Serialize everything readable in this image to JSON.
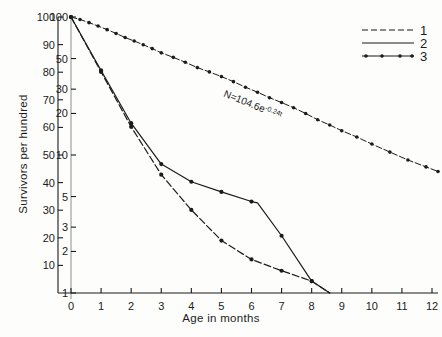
{
  "chart_data": {
    "type": "line",
    "title": "",
    "xlabel": "Age in months",
    "ylabel": "Survivors per hundred",
    "x_ticks": [
      "0",
      "1",
      "2",
      "3",
      "4",
      "5",
      "6",
      "7",
      "8",
      "9",
      "10",
      "11",
      "12"
    ],
    "xlim": [
      0,
      12
    ],
    "y_axis_left": {
      "scale": "linear",
      "ticks": [
        "100",
        "90",
        "80",
        "70",
        "60",
        "50",
        "40",
        "30",
        "20",
        "10"
      ],
      "tick_values": [
        100,
        90,
        80,
        70,
        60,
        50,
        40,
        30,
        20,
        10
      ],
      "ylim": [
        0,
        100
      ]
    },
    "y_axis_log": {
      "scale": "log",
      "ticks": [
        "100",
        "50",
        "30",
        "20",
        "10",
        "5",
        "3",
        "2",
        "1"
      ],
      "tick_values": [
        100,
        50,
        30,
        20,
        10,
        5,
        3,
        2,
        1
      ],
      "ylim": [
        1,
        100
      ]
    },
    "grid": false,
    "legend_position": "top-right",
    "annotations": [
      {
        "name": "fitted-equation",
        "text": "N=104.6e",
        "superscript": "-0.24t",
        "x": 6.0,
        "y": 22
      }
    ],
    "series": [
      {
        "name": "1",
        "label": "1",
        "style": "dashed",
        "marker": "none",
        "color": "#1b1b1b",
        "x": [
          0,
          1,
          2,
          3,
          4,
          5,
          6,
          7,
          8,
          8.6
        ],
        "y": [
          100,
          40,
          16,
          7.2,
          4.0,
          2.4,
          1.75,
          1.45,
          1.22,
          1.0
        ]
      },
      {
        "name": "2",
        "label": "2",
        "style": "solid",
        "marker": "none",
        "color": "#1b1b1b",
        "x": [
          0,
          1,
          2,
          3,
          4,
          5,
          6,
          6.2,
          7,
          8,
          8.6
        ],
        "y": [
          100,
          41,
          17,
          8.6,
          6.4,
          5.4,
          4.6,
          4.5,
          2.6,
          1.22,
          1.0
        ]
      },
      {
        "name": "3",
        "label": "3",
        "style": "dash-dot",
        "marker": "dot",
        "color": "#1b1b1b",
        "x": [
          0,
          0.3,
          0.6,
          0.9,
          1.2,
          1.5,
          1.8,
          2.1,
          2.4,
          2.7,
          3.0,
          3.4,
          3.8,
          4.2,
          4.6,
          5.0,
          5.4,
          5.8,
          6.2,
          6.6,
          7.0,
          7.4,
          7.8,
          8.2,
          8.6,
          9.0,
          9.5,
          10.0,
          10.6,
          11.2,
          11.8,
          12.2
        ],
        "y": [
          100,
          96,
          91,
          86,
          81,
          76,
          71,
          67,
          63,
          59,
          55,
          51,
          47,
          43,
          40,
          37,
          34,
          31,
          28.5,
          26,
          24,
          22,
          20,
          18,
          16.5,
          15,
          13.5,
          12,
          10.5,
          9.2,
          8.2,
          7.6
        ],
        "equation": "N=104.6e^-0.24t"
      }
    ]
  },
  "legend": {
    "entries": [
      {
        "label": "1",
        "style": "dashed"
      },
      {
        "label": "2",
        "style": "solid"
      },
      {
        "label": "3",
        "style": "dotted-markers"
      }
    ]
  }
}
